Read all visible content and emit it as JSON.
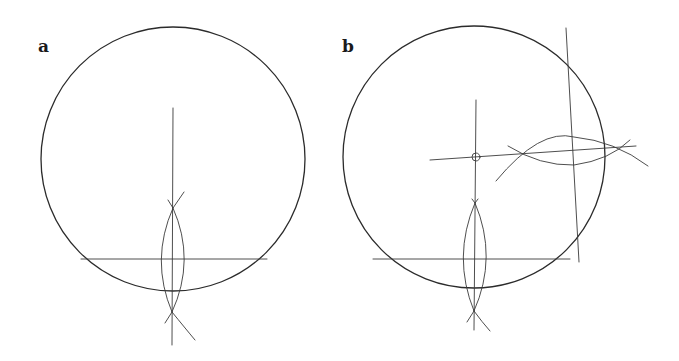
{
  "figure": {
    "panels": [
      {
        "label": "a",
        "circle": {
          "cx": 173,
          "cy": 159,
          "r": 132
        },
        "chord": {
          "x1": 81,
          "y1": 259,
          "x2": 267,
          "y2": 259
        },
        "bisector": {
          "x1": 173,
          "y1": 108,
          "x2": 172,
          "y2": 345
        },
        "lens": {
          "top": [
            173,
            208
          ],
          "bottom": [
            172,
            312
          ],
          "half_width": 15
        }
      },
      {
        "label": "b",
        "circle": {
          "cx": 474,
          "cy": 157,
          "r": 131
        },
        "chord1": {
          "x1": 373,
          "y1": 259,
          "x2": 570,
          "y2": 259
        },
        "bisector1": {
          "x1": 476,
          "y1": 100,
          "x2": 474,
          "y2": 330
        },
        "lens1": {
          "top": [
            475,
            203
          ],
          "bottom": [
            474,
            311
          ],
          "half_width": 15
        },
        "chord2": {
          "x1": 566,
          "y1": 28,
          "x2": 579,
          "y2": 262
        },
        "bisector2": {
          "x1": 430,
          "y1": 160,
          "x2": 636,
          "y2": 146
        },
        "center_marker": {
          "cx": 476,
          "cy": 157,
          "r": 4
        }
      }
    ]
  }
}
